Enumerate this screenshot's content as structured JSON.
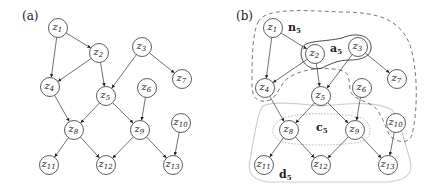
{
  "panels": [
    {
      "label": "(a)",
      "nodes": [
        {
          "id": "z1",
          "name": "z",
          "sub": "1",
          "x": 58,
          "y": 28
        },
        {
          "id": "z2",
          "name": "z",
          "sub": "2",
          "x": 99,
          "y": 53
        },
        {
          "id": "z3",
          "name": "z",
          "sub": "3",
          "x": 142,
          "y": 47
        },
        {
          "id": "z4",
          "name": "z",
          "sub": "4",
          "x": 50,
          "y": 87
        },
        {
          "id": "z5",
          "name": "z",
          "sub": "5",
          "x": 106,
          "y": 96
        },
        {
          "id": "z6",
          "name": "z",
          "sub": "6",
          "x": 147,
          "y": 88
        },
        {
          "id": "z7",
          "name": "z",
          "sub": "7",
          "x": 182,
          "y": 79
        },
        {
          "id": "z8",
          "name": "z",
          "sub": "8",
          "x": 74,
          "y": 130
        },
        {
          "id": "z9",
          "name": "z",
          "sub": "9",
          "x": 140,
          "y": 130
        },
        {
          "id": "z10",
          "name": "z",
          "sub": "10",
          "x": 181,
          "y": 123
        },
        {
          "id": "z11",
          "name": "z",
          "sub": "11",
          "x": 49,
          "y": 165
        },
        {
          "id": "z12",
          "name": "z",
          "sub": "12",
          "x": 106,
          "y": 165
        },
        {
          "id": "z13",
          "name": "z",
          "sub": "13",
          "x": 173,
          "y": 165
        }
      ]
    },
    {
      "label": "(b)",
      "nodes": [
        {
          "id": "z1",
          "name": "z",
          "sub": "1",
          "x": 273,
          "y": 28
        },
        {
          "id": "z2",
          "name": "z",
          "sub": "2",
          "x": 315,
          "y": 54
        },
        {
          "id": "z3",
          "name": "z",
          "sub": "3",
          "x": 358,
          "y": 47
        },
        {
          "id": "z4",
          "name": "z",
          "sub": "4",
          "x": 265,
          "y": 88
        },
        {
          "id": "z5",
          "name": "z",
          "sub": "5",
          "x": 321,
          "y": 96
        },
        {
          "id": "z6",
          "name": "z",
          "sub": "6",
          "x": 362,
          "y": 88
        },
        {
          "id": "z7",
          "name": "z",
          "sub": "7",
          "x": 397,
          "y": 79
        },
        {
          "id": "z8",
          "name": "z",
          "sub": "8",
          "x": 289,
          "y": 130
        },
        {
          "id": "z9",
          "name": "z",
          "sub": "9",
          "x": 355,
          "y": 130
        },
        {
          "id": "z10",
          "name": "z",
          "sub": "10",
          "x": 396,
          "y": 123
        },
        {
          "id": "z11",
          "name": "z",
          "sub": "11",
          "x": 264,
          "y": 165
        },
        {
          "id": "z12",
          "name": "z",
          "sub": "12",
          "x": 321,
          "y": 165
        },
        {
          "id": "z13",
          "name": "z",
          "sub": "13",
          "x": 388,
          "y": 165
        }
      ],
      "set_labels": {
        "n5": {
          "name": "n",
          "sub": "5"
        },
        "a5": {
          "name": "a",
          "sub": "5"
        },
        "c5": {
          "name": "c",
          "sub": "5"
        },
        "d5": {
          "name": "d",
          "sub": "5"
        }
      }
    }
  ],
  "edges": [
    [
      "z1",
      "z2"
    ],
    [
      "z1",
      "z4"
    ],
    [
      "z2",
      "z4"
    ],
    [
      "z2",
      "z5"
    ],
    [
      "z3",
      "z5"
    ],
    [
      "z3",
      "z7"
    ],
    [
      "z4",
      "z8"
    ],
    [
      "z5",
      "z8"
    ],
    [
      "z5",
      "z9"
    ],
    [
      "z6",
      "z9"
    ],
    [
      "z8",
      "z11"
    ],
    [
      "z8",
      "z12"
    ],
    [
      "z9",
      "z12"
    ],
    [
      "z9",
      "z13"
    ],
    [
      "z10",
      "z13"
    ]
  ],
  "colors": {
    "stroke": "#333333",
    "region_solid": "#333333",
    "region_dashed": "#555555",
    "region_light": "#cccccc",
    "region_dotted": "#bbbbbb"
  }
}
